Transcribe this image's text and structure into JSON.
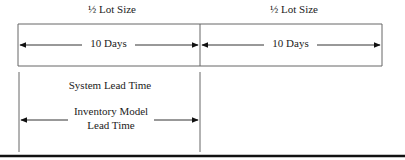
{
  "diagram": {
    "top_labels": [
      "½ Lot Size",
      "½ Lot Size"
    ],
    "interval_labels": [
      "10 Days",
      "10 Days"
    ],
    "system_lead_time_label": "System Lead Time",
    "inventory_model_lead_time_label": [
      "Inventory Model",
      "Lead Time"
    ],
    "colors": {
      "line": "#555555",
      "arrow": "#111111",
      "rule": "#111111"
    }
  }
}
